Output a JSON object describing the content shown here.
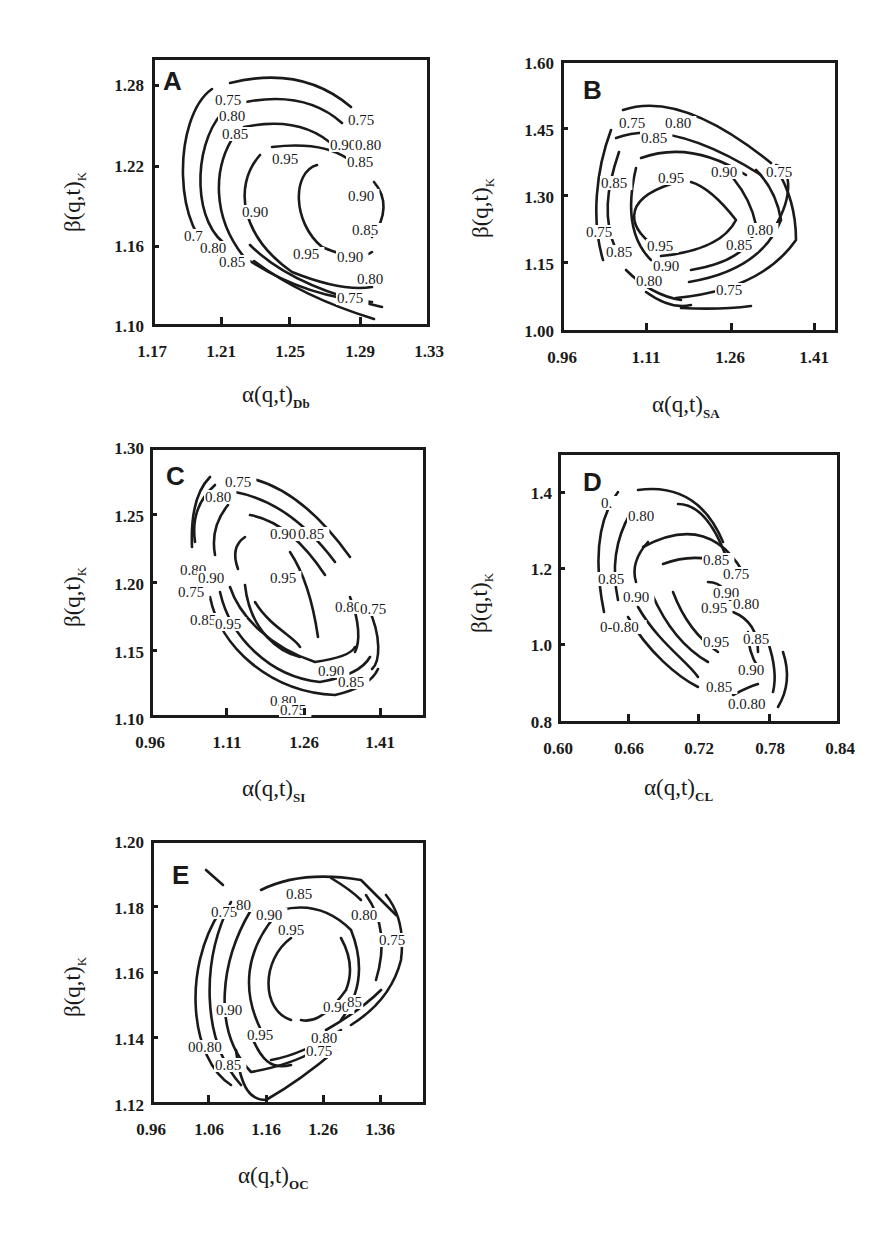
{
  "figure": {
    "panels": [
      {
        "id": "A",
        "letter": "A",
        "xlabel_main": "α(q,t)",
        "xlabel_sub": "Db",
        "ylabel_main": "β(q,t)",
        "ylabel_sub": "K",
        "xticks": [
          "1.17",
          "1.21",
          "1.25",
          "1.29",
          "1.33"
        ],
        "yticks": [
          "1.28",
          "1.22",
          "1.16",
          "1.10"
        ]
      },
      {
        "id": "B",
        "letter": "B",
        "xlabel_main": "α(q,t)",
        "xlabel_sub": "SA",
        "ylabel_main": "β(q,t)",
        "ylabel_sub": "K",
        "xticks": [
          "0.96",
          "1.11",
          "1.26",
          "1.41"
        ],
        "yticks": [
          "1.60",
          "1.45",
          "1.30",
          "1.15",
          "1.00"
        ]
      },
      {
        "id": "C",
        "letter": "C",
        "xlabel_main": "α(q,t)",
        "xlabel_sub": "SI",
        "ylabel_main": "β(q,t)",
        "ylabel_sub": "K",
        "xticks": [
          "0.96",
          "1.11",
          "1.26",
          "1.41"
        ],
        "yticks": [
          "1.30",
          "1.25",
          "1.20",
          "1.15",
          "1.10"
        ]
      },
      {
        "id": "D",
        "letter": "D",
        "xlabel_main": "α(q,t)",
        "xlabel_sub": "CL",
        "ylabel_main": "β(q,t)",
        "ylabel_sub": "K",
        "xticks": [
          "0.60",
          "0.66",
          "0.72",
          "0.78",
          "0.84"
        ],
        "yticks": [
          "1.4",
          "1.2",
          "1.0",
          "0.8"
        ]
      },
      {
        "id": "E",
        "letter": "E",
        "xlabel_main": "α(q,t)",
        "xlabel_sub": "OC",
        "ylabel_main": "β(q,t)",
        "ylabel_sub": "K",
        "xticks": [
          "0.96",
          "1.06",
          "1.16",
          "1.26",
          "1.36"
        ],
        "yticks": [
          "1.20",
          "1.18",
          "1.16",
          "1.14",
          "1.12"
        ]
      }
    ]
  },
  "chart_data": [
    {
      "type": "contour",
      "panel": "A",
      "xlabel": "α(q,t)_Db",
      "ylabel": "β(q,t)_K",
      "xlim": [
        1.17,
        1.33
      ],
      "ylim": [
        1.1,
        1.3
      ],
      "xticks": [
        1.17,
        1.21,
        1.25,
        1.29,
        1.33
      ],
      "yticks": [
        1.1,
        1.16,
        1.22,
        1.28
      ],
      "contour_levels": [
        0.75,
        0.8,
        0.85,
        0.9,
        0.95
      ],
      "peak_approx": {
        "x": 1.255,
        "y": 1.19
      },
      "grid": false,
      "legend": "none"
    },
    {
      "type": "contour",
      "panel": "B",
      "xlabel": "α(q,t)_SA",
      "ylabel": "β(q,t)_K",
      "xlim": [
        0.96,
        1.46
      ],
      "ylim": [
        1.0,
        1.6
      ],
      "xticks": [
        0.96,
        1.11,
        1.26,
        1.41
      ],
      "yticks": [
        1.0,
        1.15,
        1.3,
        1.45,
        1.6
      ],
      "contour_levels": [
        0.75,
        0.8,
        0.85,
        0.9,
        0.95
      ],
      "peak_approx": {
        "x": 1.18,
        "y": 1.27
      },
      "grid": false,
      "legend": "none"
    },
    {
      "type": "contour",
      "panel": "C",
      "xlabel": "α(q,t)_SI",
      "ylabel": "β(q,t)_K",
      "xlim": [
        0.96,
        1.46
      ],
      "ylim": [
        1.1,
        1.3
      ],
      "xticks": [
        0.96,
        1.11,
        1.26,
        1.41
      ],
      "yticks": [
        1.1,
        1.15,
        1.2,
        1.25,
        1.3
      ],
      "contour_levels": [
        0.75,
        0.8,
        0.85,
        0.9,
        0.95
      ],
      "peak_approx": {
        "x": 1.2,
        "y": 1.185
      },
      "grid": false,
      "legend": "none"
    },
    {
      "type": "contour",
      "panel": "D",
      "xlabel": "α(q,t)_CL",
      "ylabel": "β(q,t)_K",
      "xlim": [
        0.6,
        0.84
      ],
      "ylim": [
        0.8,
        1.5
      ],
      "xticks": [
        0.6,
        0.66,
        0.72,
        0.78,
        0.84
      ],
      "yticks": [
        0.8,
        1.0,
        1.2,
        1.4
      ],
      "contour_levels": [
        0.75,
        0.8,
        0.85,
        0.9,
        0.95
      ],
      "peak_approx": {
        "x": 0.73,
        "y": 1.07
      },
      "grid": false,
      "legend": "none"
    },
    {
      "type": "contour",
      "panel": "E",
      "xlabel": "α(q,t)_OC",
      "ylabel": "β(q,t)_K",
      "xlim": [
        0.96,
        1.44
      ],
      "ylim": [
        1.12,
        1.2
      ],
      "xticks": [
        0.96,
        1.06,
        1.16,
        1.26,
        1.36
      ],
      "yticks": [
        1.12,
        1.14,
        1.16,
        1.18,
        1.2
      ],
      "contour_levels": [
        0.75,
        0.8,
        0.85,
        0.9,
        0.95
      ],
      "peak_approx": {
        "x": 1.2,
        "y": 1.16
      },
      "grid": false,
      "legend": "none"
    }
  ],
  "contours": {
    "A": {
      "paths": [
        "M78 26 Q150 8 199 50",
        "M60 32 C20 60 20 180 68 198",
        "M80 48 Q150 30 190 66",
        "M70 56 C40 90 40 170 78 190",
        "M92 70 Q150 58 183 90",
        "M84 76 C60 110 60 160 92 200 Q150 240 220 245",
        "M120 90 Q170 84 196 102",
        "M108 98 C80 130 90 180 140 215 Q190 235 220 230",
        "M165 108 C140 115 140 165 170 190 Q205 205 220 195",
        "M220 180 C235 160 235 140 222 125",
        "M98 188 Q140 230 230 250",
        "M102 204 Q150 240 222 262"
      ],
      "labels": [
        {
          "x": 63,
          "y": 48,
          "t": "0.75"
        },
        {
          "x": 67,
          "y": 64,
          "t": "0.80"
        },
        {
          "x": 70,
          "y": 82,
          "t": "0.85"
        },
        {
          "x": 196,
          "y": 68,
          "t": "0.75"
        },
        {
          "x": 178,
          "y": 93,
          "t": "0.90"
        },
        {
          "x": 203,
          "y": 93,
          "t": "0.80"
        },
        {
          "x": 120,
          "y": 107,
          "t": "0.95"
        },
        {
          "x": 195,
          "y": 110,
          "t": "0.85"
        },
        {
          "x": 196,
          "y": 144,
          "t": "0.90"
        },
        {
          "x": 90,
          "y": 160,
          "t": "0.90"
        },
        {
          "x": 200,
          "y": 178,
          "t": "0.85"
        },
        {
          "x": 32,
          "y": 184,
          "t": "0.7"
        },
        {
          "x": 48,
          "y": 196,
          "t": "0.80"
        },
        {
          "x": 141,
          "y": 202,
          "t": "0.95"
        },
        {
          "x": 185,
          "y": 205,
          "t": "0.90"
        },
        {
          "x": 67,
          "y": 210,
          "t": "0.85"
        },
        {
          "x": 205,
          "y": 227,
          "t": "0.80"
        },
        {
          "x": 185,
          "y": 246,
          "t": "0.75"
        }
      ]
    },
    "B": {
      "paths": [
        "M62 50 Q120 30 210 103",
        "M50 70 C35 110 30 160 42 200",
        "M55 78 Q110 58 200 115",
        "M58 92 C45 130 42 160 55 190",
        "M80 98 Q130 80 185 115",
        "M75 108 C65 150 70 180 90 200",
        "M110 124 C60 140 65 170 100 190",
        "M100 196 Q160 190 175 160 Q150 128 130 122",
        "M130 210 Q190 200 195 165 Q190 140 172 118",
        "M128 222 Q200 210 220 160 Q215 130 195 110",
        "M115 238 Q200 230 235 180 Q235 140 215 108",
        "M210 173 C232 140 232 110 215 105",
        "M65 210 Q90 235 120 240",
        "M120 248 Q160 250 190 246",
        "M85 232 Q110 250 130 245"
      ],
      "labels": [
        {
          "x": 58,
          "y": 68,
          "t": "0.75"
        },
        {
          "x": 104,
          "y": 68,
          "t": "0.80"
        },
        {
          "x": 80,
          "y": 83,
          "t": "0.85"
        },
        {
          "x": 205,
          "y": 117,
          "t": "0.75"
        },
        {
          "x": 150,
          "y": 117,
          "t": "0.90"
        },
        {
          "x": 97,
          "y": 123,
          "t": "0.95"
        },
        {
          "x": 40,
          "y": 128,
          "t": "0.85"
        },
        {
          "x": 25,
          "y": 177,
          "t": "0.75"
        },
        {
          "x": 186,
          "y": 175,
          "t": "0.80"
        },
        {
          "x": 165,
          "y": 190,
          "t": "0.85"
        },
        {
          "x": 86,
          "y": 191,
          "t": "0.95"
        },
        {
          "x": 45,
          "y": 197,
          "t": "0.85"
        },
        {
          "x": 92,
          "y": 211,
          "t": "0.90"
        },
        {
          "x": 75,
          "y": 226,
          "t": "0.80"
        },
        {
          "x": 155,
          "y": 235,
          "t": "0.75"
        }
      ]
    },
    "C": {
      "paths": [
        "M60 30 Q40 50 42 100",
        "M65 38 Q40 60 45 95",
        "M95 30 Q150 40 200 110",
        "M85 45 Q140 55 185 115",
        "M78 58 Q60 80 65 108",
        "M100 68 Q140 75 175 128",
        "M95 90 Q80 100 88 122",
        "M140 105 Q160 135 168 190",
        "M80 140 C90 170 120 200 165 215 Q200 210 205 200",
        "M95 138 C100 185 130 205 150 210",
        "M105 155 C120 180 145 190 150 200",
        "M70 145 C80 190 120 230 170 235 Q210 228 220 210",
        "M60 150 C70 200 120 245 185 248 Q220 240 228 222",
        "M200 150 C210 175 210 195 205 205",
        "M218 160 C232 190 230 215 222 222"
      ],
      "labels": [
        {
          "x": 75,
          "y": 40,
          "t": "0.75"
        },
        {
          "x": 55,
          "y": 55,
          "t": "0.80"
        },
        {
          "x": 120,
          "y": 92,
          "t": "0.90"
        },
        {
          "x": 148,
          "y": 92,
          "t": "0.85"
        },
        {
          "x": 30,
          "y": 128,
          "t": "0.80"
        },
        {
          "x": 48,
          "y": 136,
          "t": "0.90"
        },
        {
          "x": 120,
          "y": 136,
          "t": "0.95"
        },
        {
          "x": 28,
          "y": 150,
          "t": "0.75"
        },
        {
          "x": 185,
          "y": 165,
          "t": "0.80"
        },
        {
          "x": 210,
          "y": 167,
          "t": "0.75"
        },
        {
          "x": 40,
          "y": 178,
          "t": "0.85"
        },
        {
          "x": 65,
          "y": 182,
          "t": "0.95"
        },
        {
          "x": 168,
          "y": 229,
          "t": "0.90"
        },
        {
          "x": 188,
          "y": 240,
          "t": "0.85"
        },
        {
          "x": 120,
          "y": 259,
          "t": "0.80"
        },
        {
          "x": 130,
          "y": 268,
          "t": "0.75"
        }
      ]
    },
    "D": {
      "paths": [
        "M60 40 Q30 80 46 160",
        "M80 38 Q140 30 165 90",
        "M120 52 Q150 52 170 110",
        "M72 62 Q50 100 60 148",
        "M85 95 Q150 60 185 120",
        "M90 90 Q72 110 78 130",
        "M105 112 Q150 95 190 125",
        "M150 130 Q170 130 175 160 Q200 170 200 200",
        "M115 140 Q130 180 160 200",
        "M94 142 Q115 190 150 210",
        "M80 155 C100 190 130 210 140 225",
        "M70 165 C90 200 120 225 140 235",
        "M190 180 Q190 200 200 215",
        "M210 190 Q220 220 215 240",
        "M225 200 Q235 230 220 255",
        "M175 243 Q190 235 200 232"
      ],
      "labels": [
        {
          "x": 43,
          "y": 56,
          "t": "0."
        },
        {
          "x": 70,
          "y": 69,
          "t": "0.80"
        },
        {
          "x": 145,
          "y": 113,
          "t": "0.85"
        },
        {
          "x": 165,
          "y": 127,
          "t": "0.75"
        },
        {
          "x": 40,
          "y": 132,
          "t": "0.85"
        },
        {
          "x": 155,
          "y": 146,
          "t": "0.90"
        },
        {
          "x": 65,
          "y": 150,
          "t": "0.90"
        },
        {
          "x": 143,
          "y": 161,
          "t": "0.95"
        },
        {
          "x": 175,
          "y": 157,
          "t": "0.80"
        },
        {
          "x": 42,
          "y": 180,
          "t": "0-0.80"
        },
        {
          "x": 145,
          "y": 195,
          "t": "0.95"
        },
        {
          "x": 185,
          "y": 192,
          "t": "0.85"
        },
        {
          "x": 180,
          "y": 223,
          "t": "0.90"
        },
        {
          "x": 148,
          "y": 240,
          "t": "0.85"
        },
        {
          "x": 170,
          "y": 257,
          "t": "0.0.80"
        }
      ]
    },
    "E": {
      "paths": [
        "M55 30 L72 45",
        "M70 70 C30 130 40 220 80 245",
        "M80 62 C50 120 50 200 90 245",
        "M110 50 Q150 30 210 40 Q230 60 245 75",
        "M180 38 Q200 50 210 60",
        "M100 70 C70 120 60 190 100 232 Q140 225 165 210",
        "M130 70 Q170 60 200 90 Q220 140 190 180",
        "M125 75 C95 110 90 150 110 190",
        "M140 98 C110 120 110 170 140 180",
        "M150 180 Q170 185 195 150 Q205 125 190 98",
        "M235 55 Q255 80 250 120 Q240 160 200 185",
        "M215 55 Q240 90 225 140",
        "M230 150 Q210 170 175 190",
        "M100 195 C110 220 120 230 140 225",
        "M120 220 Q150 215 190 190",
        "M85 210 C90 250 100 260 115 260 Q150 240 185 210"
      ],
      "labels": [
        {
          "x": 60,
          "y": 77,
          "t": "0.75"
        },
        {
          "x": 85,
          "y": 70,
          "t": "80"
        },
        {
          "x": 135,
          "y": 59,
          "t": "0.85"
        },
        {
          "x": 105,
          "y": 80,
          "t": "0.90"
        },
        {
          "x": 127,
          "y": 95,
          "t": "0.95"
        },
        {
          "x": 200,
          "y": 80,
          "t": "0.80"
        },
        {
          "x": 228,
          "y": 105,
          "t": "0.75"
        },
        {
          "x": 65,
          "y": 175,
          "t": "0.90"
        },
        {
          "x": 172,
          "y": 172,
          "t": "0.90"
        },
        {
          "x": 196,
          "y": 167,
          "t": "85"
        },
        {
          "x": 96,
          "y": 200,
          "t": "0.95"
        },
        {
          "x": 160,
          "y": 203,
          "t": "0.80"
        },
        {
          "x": 37,
          "y": 212,
          "t": "00.80"
        },
        {
          "x": 155,
          "y": 216,
          "t": "0.75"
        },
        {
          "x": 64,
          "y": 230,
          "t": "0.85"
        }
      ]
    }
  }
}
